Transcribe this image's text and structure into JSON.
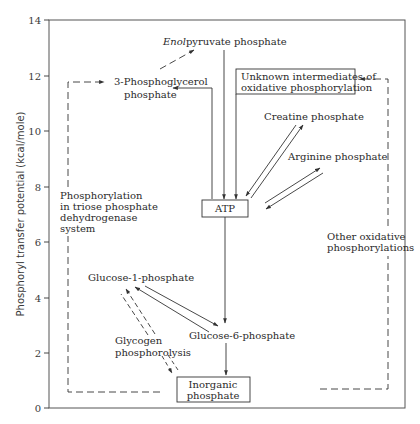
{
  "figure": {
    "y_axis": {
      "label": "Phosphoryl transfer potential (kcal/mole)",
      "ticks": [
        "0",
        "2",
        "4",
        "6",
        "8",
        "10",
        "12",
        "14"
      ],
      "range": [
        0,
        14
      ]
    },
    "nodes": {
      "enolpyruvate": {
        "italic": "Enol",
        "rest": "pyruvate phosphate"
      },
      "phosphoglycerol": {
        "line1": "3-Phosphoglycerol",
        "line2": "phosphate"
      },
      "unknown_intermediates": {
        "line1": "Unknown intermediates of",
        "line2": "oxidative phosphorylation"
      },
      "creatine": {
        "label": "Creatine phosphate"
      },
      "arginine": {
        "label": "Arginine phosphate"
      },
      "atp": {
        "label": "ATP"
      },
      "glucose1p": {
        "label": "Glucose-1-phosphate"
      },
      "glucose6p": {
        "label": "Glucose-6-phosphate"
      },
      "inorganic": {
        "line1": "Inorganic",
        "line2": "phosphate"
      }
    },
    "annotations": {
      "triose": {
        "line1": "Phosphorylation",
        "line2": "in triose phosphate",
        "line3": "dehydrogenase",
        "line4": "system"
      },
      "glycogen": {
        "line1": "Glycogen",
        "line2": "phosphorolysis"
      },
      "other_oxidative": {
        "line1": "Other oxidative",
        "line2": "phosphorylations"
      }
    }
  }
}
